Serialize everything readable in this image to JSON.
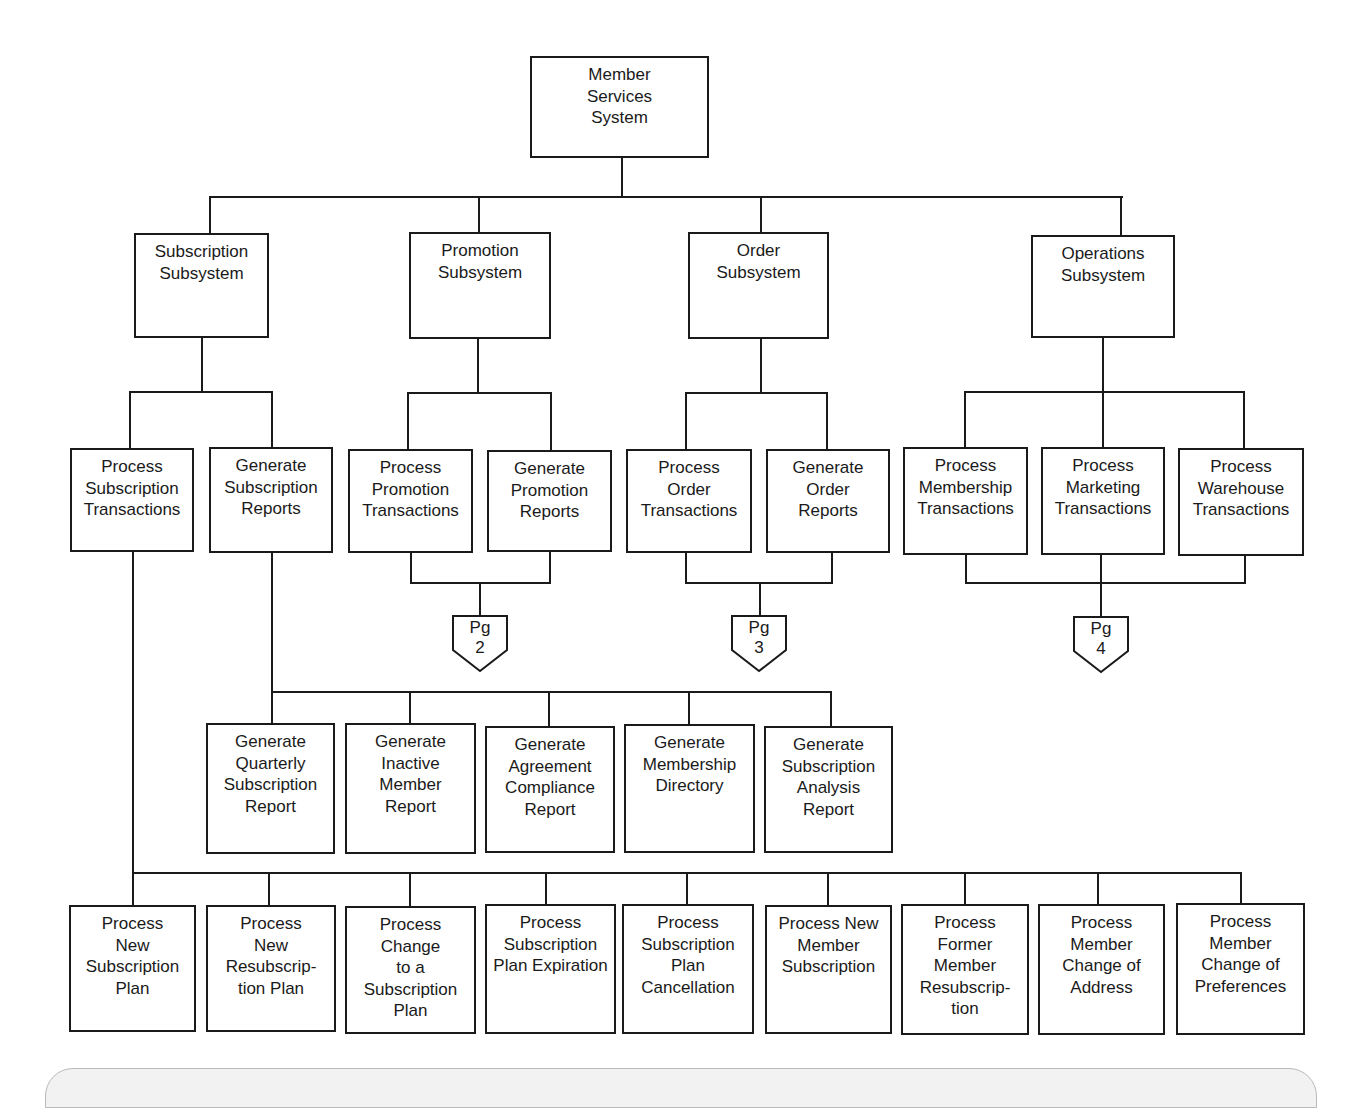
{
  "diagram": {
    "type": "hierarchy-chart",
    "root": {
      "id": "root",
      "label": "Member\nServices\nSystem"
    },
    "subsystems": [
      {
        "id": "sub",
        "label": "Subscription\nSubsystem"
      },
      {
        "id": "promo",
        "label": "Promotion\nSubsystem"
      },
      {
        "id": "order",
        "label": "Order\nSubsystem"
      },
      {
        "id": "ops",
        "label": "Operations\nSubsystem"
      }
    ],
    "level3": [
      {
        "id": "pst",
        "parent": "sub",
        "label": "Process\nSubscription\nTransactions"
      },
      {
        "id": "gsr",
        "parent": "sub",
        "label": "Generate\nSubscription\nReports"
      },
      {
        "id": "ppt",
        "parent": "promo",
        "label": "Process\nPromotion\nTransactions"
      },
      {
        "id": "gpr",
        "parent": "promo",
        "label": "Generate\nPromotion\nReports"
      },
      {
        "id": "pot",
        "parent": "order",
        "label": "Process\nOrder\nTransactions"
      },
      {
        "id": "gor",
        "parent": "order",
        "label": "Generate\nOrder\nReports"
      },
      {
        "id": "pmt",
        "parent": "ops",
        "label": "Process\nMembership\nTransactions"
      },
      {
        "id": "pmkt",
        "parent": "ops",
        "label": "Process\nMarketing\nTransactions"
      },
      {
        "id": "pwt",
        "parent": "ops",
        "label": "Process\nWarehouse\nTransactions"
      }
    ],
    "page_connectors": [
      {
        "id": "pg2",
        "label": "Pg\n2"
      },
      {
        "id": "pg3",
        "label": "Pg\n3"
      },
      {
        "id": "pg4",
        "label": "Pg\n4"
      }
    ],
    "reports": [
      {
        "label": "Generate\nQuarterly\nSubscription\nReport"
      },
      {
        "label": "Generate\nInactive\nMember\nReport"
      },
      {
        "label": "Generate\nAgreement\nCompliance\nReport"
      },
      {
        "label": "Generate\nMembership\nDirectory"
      },
      {
        "label": "Generate\nSubscription\nAnalysis\nReport"
      }
    ],
    "transactions": [
      {
        "label": "Process\nNew\nSubscription\nPlan"
      },
      {
        "label": "Process\nNew\nResubscrip-\ntion Plan"
      },
      {
        "label": "Process\nChange\nto a\nSubscription\nPlan"
      },
      {
        "label": "Process\nSubscription\nPlan Expiration"
      },
      {
        "label": "Process\nSubscription\nPlan\nCancellation"
      },
      {
        "label": "Process New\nMember\nSubscription"
      },
      {
        "label": "Process\nFormer\nMember\nResubscrip-\ntion"
      },
      {
        "label": "Process\nMember\nChange of\nAddress"
      },
      {
        "label": "Process\nMember\nChange of\nPreferences"
      }
    ]
  },
  "colors": {
    "line": "#1a1a1a",
    "box_fill": "#ffffff",
    "panel_fill": "#f2f2f2",
    "panel_border": "#b9b9b9"
  }
}
